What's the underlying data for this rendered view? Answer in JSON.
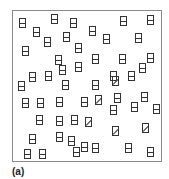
{
  "figure": {
    "label": "(a)",
    "colors": {
      "frame": "#8a8a8a",
      "glyph": "#333333"
    },
    "items": [
      {
        "x": 22,
        "y": 23,
        "type": "h"
      },
      {
        "x": 54,
        "y": 19,
        "type": "h"
      },
      {
        "x": 73,
        "y": 23,
        "type": "h"
      },
      {
        "x": 123,
        "y": 21,
        "type": "h"
      },
      {
        "x": 150,
        "y": 20,
        "type": "h"
      },
      {
        "x": 36,
        "y": 32,
        "type": "h"
      },
      {
        "x": 92,
        "y": 31,
        "type": "h"
      },
      {
        "x": 66,
        "y": 37,
        "type": "h"
      },
      {
        "x": 106,
        "y": 39,
        "type": "h"
      },
      {
        "x": 138,
        "y": 38,
        "type": "h"
      },
      {
        "x": 47,
        "y": 42,
        "type": "h"
      },
      {
        "x": 25,
        "y": 51,
        "type": "h"
      },
      {
        "x": 78,
        "y": 48,
        "type": "h"
      },
      {
        "x": 58,
        "y": 60,
        "type": "h"
      },
      {
        "x": 95,
        "y": 59,
        "type": "h"
      },
      {
        "x": 122,
        "y": 59,
        "type": "h"
      },
      {
        "x": 150,
        "y": 58,
        "type": "h"
      },
      {
        "x": 32,
        "y": 77,
        "type": "h"
      },
      {
        "x": 48,
        "y": 76,
        "type": "h"
      },
      {
        "x": 62,
        "y": 70,
        "type": "h"
      },
      {
        "x": 78,
        "y": 67,
        "type": "h"
      },
      {
        "x": 113,
        "y": 76,
        "type": "h"
      },
      {
        "x": 142,
        "y": 68,
        "type": "h"
      },
      {
        "x": 21,
        "y": 86,
        "type": "h"
      },
      {
        "x": 65,
        "y": 85,
        "type": "h"
      },
      {
        "x": 95,
        "y": 85,
        "type": "h"
      },
      {
        "x": 115,
        "y": 81,
        "type": "d"
      },
      {
        "x": 131,
        "y": 76,
        "type": "h"
      },
      {
        "x": 25,
        "y": 103,
        "type": "h"
      },
      {
        "x": 40,
        "y": 103,
        "type": "h"
      },
      {
        "x": 59,
        "y": 102,
        "type": "h"
      },
      {
        "x": 84,
        "y": 102,
        "type": "h"
      },
      {
        "x": 98,
        "y": 100,
        "type": "d"
      },
      {
        "x": 117,
        "y": 98,
        "type": "h"
      },
      {
        "x": 144,
        "y": 97,
        "type": "h"
      },
      {
        "x": 39,
        "y": 120,
        "type": "h"
      },
      {
        "x": 59,
        "y": 121,
        "type": "h"
      },
      {
        "x": 74,
        "y": 120,
        "type": "h"
      },
      {
        "x": 88,
        "y": 122,
        "type": "d"
      },
      {
        "x": 113,
        "y": 110,
        "type": "h"
      },
      {
        "x": 134,
        "y": 107,
        "type": "h"
      },
      {
        "x": 156,
        "y": 109,
        "type": "h"
      },
      {
        "x": 32,
        "y": 139,
        "type": "h"
      },
      {
        "x": 59,
        "y": 137,
        "type": "h"
      },
      {
        "x": 71,
        "y": 141,
        "type": "h"
      },
      {
        "x": 115,
        "y": 131,
        "type": "d"
      },
      {
        "x": 145,
        "y": 128,
        "type": "d"
      },
      {
        "x": 84,
        "y": 147,
        "type": "h"
      },
      {
        "x": 27,
        "y": 154,
        "type": "h"
      },
      {
        "x": 42,
        "y": 154,
        "type": "h"
      },
      {
        "x": 76,
        "y": 152,
        "type": "h"
      },
      {
        "x": 95,
        "y": 148,
        "type": "h"
      },
      {
        "x": 128,
        "y": 148,
        "type": "h"
      },
      {
        "x": 150,
        "y": 152,
        "type": "h"
      }
    ]
  }
}
